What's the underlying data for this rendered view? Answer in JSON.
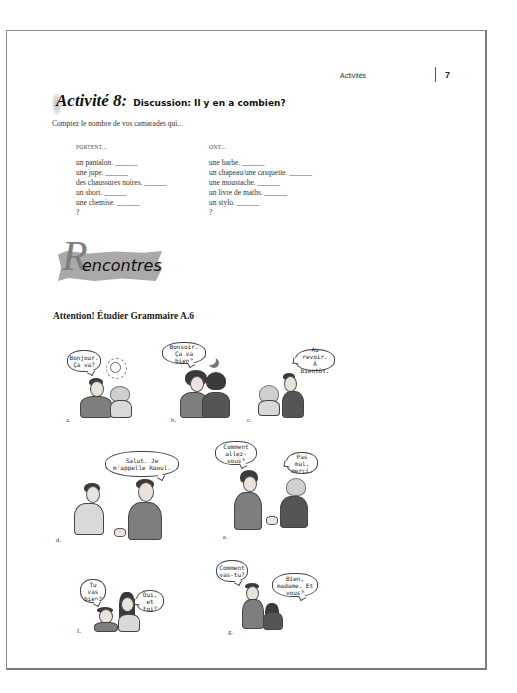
{
  "header": {
    "running_head": "Activités",
    "page_number": "7"
  },
  "activity": {
    "label": "Activité 8:",
    "subtitle": "Discussion: Il y en a combien?",
    "instruction": "Comptez le nombre de vos camarades qui...",
    "columns": [
      {
        "heading": "PORTENT...",
        "items": [
          "un pantalon. ______",
          "une jupe. ______",
          "des chaussures noires. ______",
          "un short. ______",
          "une chemise. ______",
          "?"
        ]
      },
      {
        "heading": "ONT...",
        "items": [
          "une barbe. ______",
          "un chapeau/une casquette. ______",
          "une moustache. ______",
          "un livre de maths. ______",
          "un stylo. ______",
          "?"
        ]
      }
    ]
  },
  "section": {
    "title_initial": "R",
    "title_rest": "encontres",
    "attention": "Attention! Étudier Grammaire A.6"
  },
  "panels": [
    {
      "label": "a.",
      "bubbles": [
        "Bonjour. Ça va?"
      ]
    },
    {
      "label": "b.",
      "bubbles": [
        "Bonsoir. Ça va bien?"
      ]
    },
    {
      "label": "c.",
      "bubbles": [
        "Au revoir. À bientôt."
      ]
    },
    {
      "label": "d.",
      "bubbles": [
        "Salut. Je m'appelle Raoul."
      ]
    },
    {
      "label": "e.",
      "bubbles": [
        "Comment allez-vous?",
        "Pas mal, merci."
      ]
    },
    {
      "label": "f.",
      "bubbles": [
        "Tu vas bien?",
        "Oui, et toi?"
      ]
    },
    {
      "label": "g.",
      "bubbles": [
        "Comment vas-tu?",
        "Bien, madame. Et vous?"
      ]
    }
  ]
}
